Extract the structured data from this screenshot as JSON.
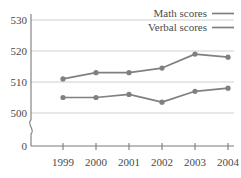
{
  "chart_data": {
    "type": "line",
    "title": "",
    "subtitle": "",
    "xlabel": "",
    "ylabel": "",
    "categories": [
      "1999",
      "2000",
      "2001",
      "2002",
      "2003",
      "2004"
    ],
    "x": [
      1999,
      2000,
      2001,
      2002,
      2003,
      2004
    ],
    "series": [
      {
        "name": "Math scores",
        "values": [
          511,
          513,
          513,
          514.5,
          519,
          518
        ],
        "color": "#808080"
      },
      {
        "name": "Verbal scores",
        "values": [
          505,
          505,
          506,
          503.5,
          507,
          508
        ],
        "color": "#808080"
      }
    ],
    "ytick_labels": [
      "530",
      "520",
      "510",
      "500",
      "0"
    ],
    "ytick_values": [
      530,
      520,
      510,
      500,
      0
    ],
    "ylim": [
      500,
      530
    ],
    "axis_break": true,
    "grid": "horizontal",
    "legend_position": "top-right",
    "legend_entries": [
      {
        "label": "Math scores",
        "color": "#808080"
      },
      {
        "label": "Verbal scores",
        "color": "#808080"
      }
    ]
  },
  "axes": {
    "y_labels": [
      {
        "text": "530",
        "value": 530
      },
      {
        "text": "520",
        "value": 520
      },
      {
        "text": "510",
        "value": 510
      },
      {
        "text": "500",
        "value": 500
      },
      {
        "text": "0",
        "value": 0
      }
    ],
    "x_labels": [
      {
        "text": "1999"
      },
      {
        "text": "2000"
      },
      {
        "text": "2001"
      },
      {
        "text": "2002"
      },
      {
        "text": "2003"
      },
      {
        "text": "2004"
      }
    ]
  },
  "legend": {
    "items": [
      {
        "label": "Math scores"
      },
      {
        "label": "Verbal scores"
      }
    ]
  },
  "colors": {
    "series": "#808080",
    "grid": "#c9c9c9",
    "axis": "#7a7a7a",
    "text": "#4a4a4a",
    "background": "#ffffff"
  }
}
